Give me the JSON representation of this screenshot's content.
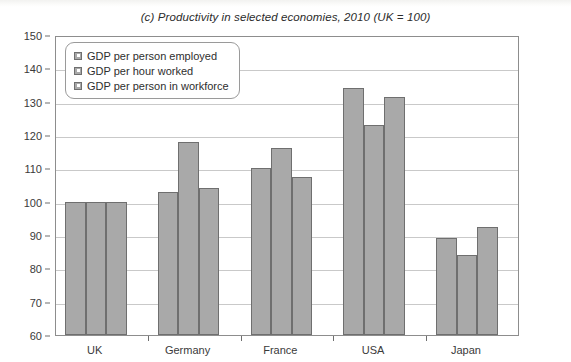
{
  "chart_data": {
    "type": "bar",
    "title": "(c) Productivity in selected economies, 2010 (UK = 100)",
    "categories": [
      "UK",
      "Germany",
      "France",
      "USA",
      "Japan"
    ],
    "series": [
      {
        "name": "GDP per person employed",
        "values": [
          100,
          103,
          110,
          134,
          89
        ]
      },
      {
        "name": "GDP per hour worked",
        "values": [
          100,
          118,
          116,
          123,
          84
        ]
      },
      {
        "name": "GDP per person in workforce",
        "values": [
          100,
          104,
          107.5,
          131.5,
          92.5
        ]
      }
    ],
    "xlabel": "",
    "ylabel": "",
    "ylim": [
      60,
      150
    ],
    "ytick_step": 10,
    "yticks": [
      60,
      70,
      80,
      90,
      100,
      110,
      120,
      130,
      140,
      150
    ],
    "grid": true,
    "legend_position": "top-left",
    "bar_color": "#a9a9a9",
    "bar_border_color": "#6f6f6f"
  },
  "figure": {
    "source_note": ""
  }
}
